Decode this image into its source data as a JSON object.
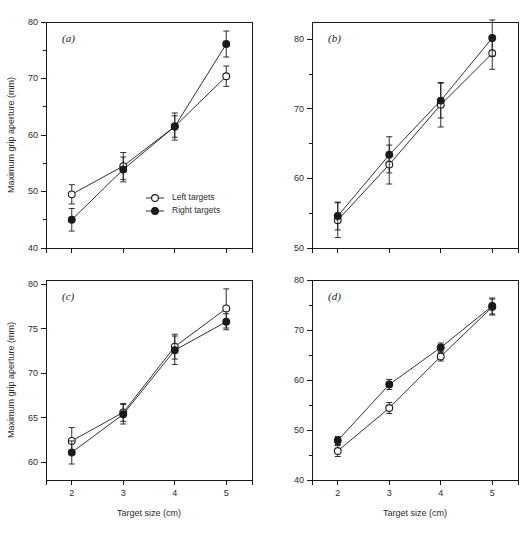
{
  "figure": {
    "width": 527,
    "height": 542,
    "background": "#ffffff",
    "ink_color": "#1a1a1a",
    "text_color": "#2b2b2b"
  },
  "axis_titles": {
    "y": "Maximum grip aperture (mm)",
    "x": "Target size (cm)"
  },
  "legend": {
    "position": "inside panel (a), lower right",
    "entries": [
      {
        "label": "Left targets",
        "marker": "open-circle"
      },
      {
        "label": "Right targets",
        "marker": "filled-circle"
      }
    ]
  },
  "chart_data": [
    {
      "type": "line",
      "panel": "(a)",
      "title": "",
      "xlabel": "",
      "ylabel": "Maximum grip aperture (mm)",
      "x": [
        2,
        3,
        4,
        5
      ],
      "categories": [
        "2",
        "3",
        "4",
        "5"
      ],
      "xlim": [
        1.5,
        5.5
      ],
      "ylim": [
        40,
        80
      ],
      "yticks": [
        40,
        50,
        60,
        70,
        80
      ],
      "yminorticks": [
        45,
        55,
        65,
        75
      ],
      "xticks": [
        2,
        3,
        4,
        5
      ],
      "grid": false,
      "series": [
        {
          "name": "Left targets",
          "marker": "open-circle",
          "values": [
            49.5,
            54.5,
            61.5,
            70.4
          ],
          "errors": [
            1.7,
            2.4,
            1.9,
            1.8
          ]
        },
        {
          "name": "Right targets",
          "marker": "filled-circle",
          "values": [
            45.0,
            53.9,
            61.5,
            76.1
          ],
          "errors": [
            2.0,
            2.2,
            2.4,
            2.3
          ]
        }
      ]
    },
    {
      "type": "line",
      "panel": "(b)",
      "title": "",
      "xlabel": "",
      "ylabel": "",
      "x": [
        2,
        3,
        4,
        5
      ],
      "categories": [
        "2",
        "3",
        "4",
        "5"
      ],
      "xlim": [
        1.5,
        5.5
      ],
      "ylim": [
        50,
        82.5
      ],
      "yticks": [
        50,
        60,
        70,
        80
      ],
      "yminorticks": [
        55,
        65,
        75
      ],
      "xticks": [
        2,
        3,
        4,
        5
      ],
      "grid": false,
      "series": [
        {
          "name": "Left targets",
          "marker": "open-circle",
          "values": [
            54.0,
            62.0,
            70.6,
            78.0
          ],
          "errors": [
            2.5,
            2.8,
            3.2,
            2.3
          ]
        },
        {
          "name": "Right targets",
          "marker": "filled-circle",
          "values": [
            54.6,
            63.4,
            71.2,
            80.2
          ],
          "errors": [
            2.0,
            2.6,
            2.5,
            2.6
          ]
        }
      ]
    },
    {
      "type": "line",
      "panel": "(c)",
      "title": "",
      "xlabel": "Target size (cm)",
      "ylabel": "Maximum grip aperture (mm)",
      "x": [
        2,
        3,
        4,
        5
      ],
      "categories": [
        "2",
        "3",
        "4",
        "5"
      ],
      "xlim": [
        1.5,
        5.5
      ],
      "ylim": [
        58,
        80.5
      ],
      "yticks": [
        60,
        65,
        70,
        75,
        80
      ],
      "yminorticks": [],
      "xticks": [
        2,
        3,
        4,
        5
      ],
      "grid": false,
      "series": [
        {
          "name": "Left targets",
          "marker": "open-circle",
          "values": [
            62.4,
            65.6,
            73.0,
            77.3
          ],
          "errors": [
            1.5,
            1.0,
            1.4,
            2.2
          ]
        },
        {
          "name": "Right targets",
          "marker": "filled-circle",
          "values": [
            61.1,
            65.4,
            72.6,
            75.8
          ],
          "errors": [
            1.3,
            1.1,
            1.6,
            0.9
          ]
        }
      ]
    },
    {
      "type": "line",
      "panel": "(d)",
      "title": "",
      "xlabel": "Target size (cm)",
      "ylabel": "",
      "x": [
        2,
        3,
        4,
        5
      ],
      "categories": [
        "2",
        "3",
        "4",
        "5"
      ],
      "xlim": [
        1.5,
        5.5
      ],
      "ylim": [
        40,
        80
      ],
      "yticks": [
        40,
        50,
        60,
        70,
        80
      ],
      "yminorticks": [
        45,
        55,
        65,
        75
      ],
      "xticks": [
        2,
        3,
        4,
        5
      ],
      "grid": false,
      "series": [
        {
          "name": "Left targets",
          "marker": "open-circle",
          "values": [
            45.8,
            54.4,
            64.7,
            74.6
          ],
          "errors": [
            1.1,
            1.1,
            0.9,
            1.6
          ]
        },
        {
          "name": "Right targets",
          "marker": "filled-circle",
          "values": [
            47.9,
            59.1,
            66.5,
            74.8
          ],
          "errors": [
            0.8,
            1.0,
            0.9,
            1.6
          ]
        }
      ]
    }
  ],
  "panels": [
    {
      "id": "a",
      "letter": "(a)"
    },
    {
      "id": "b",
      "letter": "(b)"
    },
    {
      "id": "c",
      "letter": "(c)"
    },
    {
      "id": "d",
      "letter": "(d)"
    }
  ]
}
